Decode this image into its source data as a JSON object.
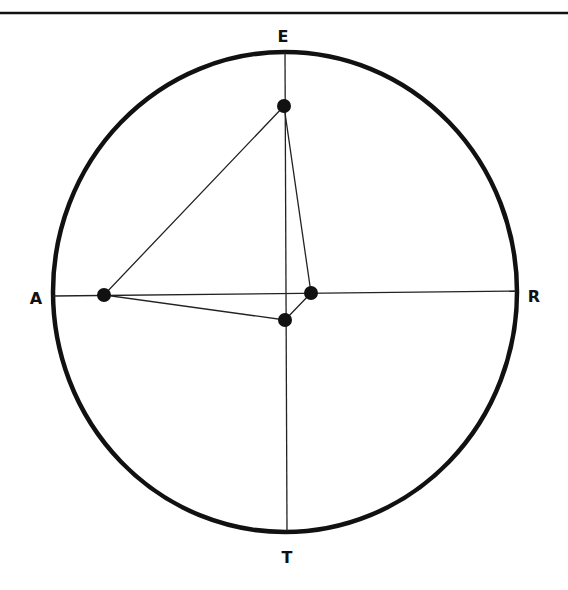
{
  "diagram": {
    "type": "compass-circle-plot",
    "colors": {
      "ink": "#111111",
      "background": "#ffffff"
    },
    "top_rule": {
      "y": 13,
      "thickness": 2.5
    },
    "circle": {
      "cx": 285,
      "cy": 292,
      "rx": 232,
      "ry": 240,
      "stroke_width": 4.5
    },
    "axes": {
      "horizontal": {
        "x1": 53,
        "y1": 296,
        "x2": 516,
        "y2": 291
      },
      "vertical": {
        "x1": 285,
        "y1": 52,
        "x2": 287,
        "y2": 531
      }
    },
    "labels": {
      "top": {
        "text": "E",
        "x": 283,
        "y": 42
      },
      "left": {
        "text": "A",
        "x": 36,
        "y": 304
      },
      "right": {
        "text": "R",
        "x": 534,
        "y": 302
      },
      "bottom": {
        "text": "T",
        "x": 287,
        "y": 563
      }
    },
    "points": [
      {
        "name": "point-top",
        "x": 284,
        "y": 106
      },
      {
        "name": "point-left",
        "x": 104,
        "y": 295
      },
      {
        "name": "point-bottom",
        "x": 285,
        "y": 320
      },
      {
        "name": "point-right",
        "x": 311,
        "y": 293
      }
    ],
    "point_radius": 7,
    "polygon_order": [
      "point-top",
      "point-left",
      "point-bottom",
      "point-right"
    ]
  }
}
